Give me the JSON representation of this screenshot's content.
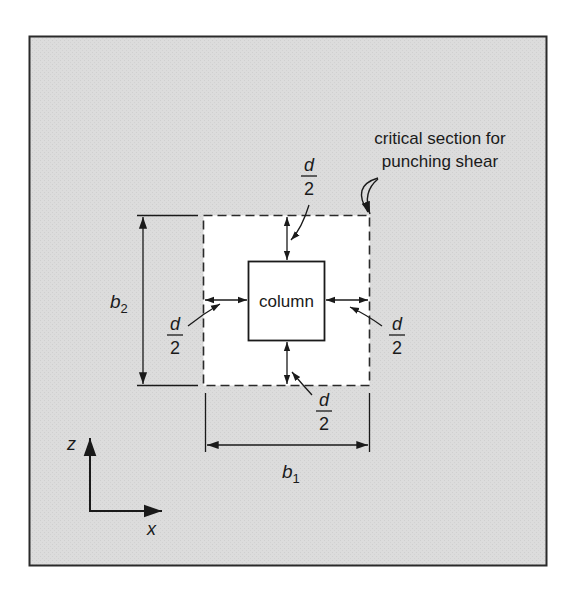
{
  "figure": {
    "background_color": "#dcdcdc",
    "frame_color": "#2a2a2a",
    "section_fill": "#ffffff",
    "callout": {
      "line1": "critical section for",
      "line2": "punching shear"
    },
    "column_label": "column",
    "offset_labels": {
      "top": {
        "num": "d",
        "den": "2"
      },
      "left": {
        "num": "d",
        "den": "2"
      },
      "right": {
        "num": "d",
        "den": "2"
      },
      "bottom": {
        "num": "d",
        "den": "2"
      }
    },
    "dimensions": {
      "b1": {
        "base": "b",
        "sub": "1"
      },
      "b2": {
        "base": "b",
        "sub": "2"
      }
    },
    "axes": {
      "vertical": "z",
      "horizontal": "x"
    }
  }
}
